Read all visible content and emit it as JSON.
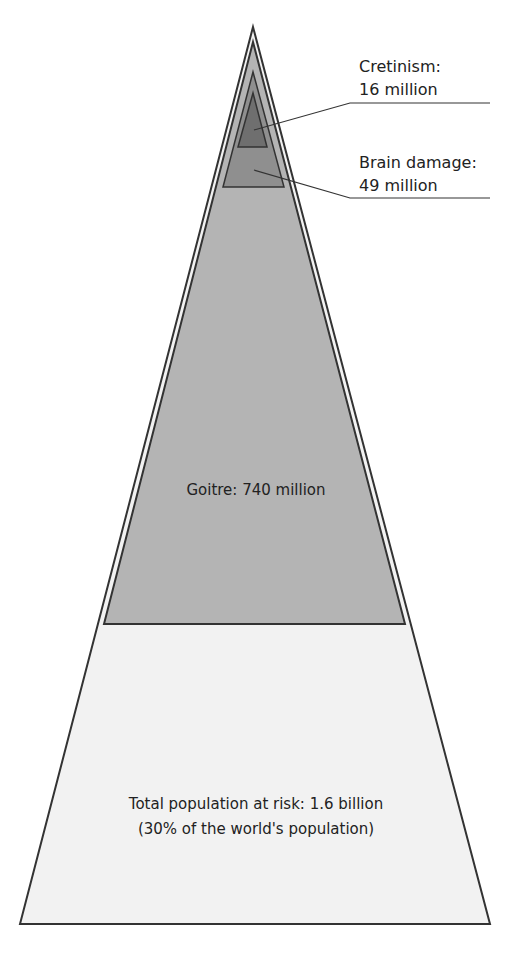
{
  "levels": {
    "cretinism": {
      "label_line1": "Cretinism:",
      "label_line2": "16 million",
      "value_millions": 16,
      "color": "#6f6f6f"
    },
    "brain_damage": {
      "label_line1": "Brain damage:",
      "label_line2": "49 million",
      "value_millions": 49,
      "color": "#8f8f8f"
    },
    "goitre": {
      "label": "Goitre: 740 million",
      "value_millions": 740,
      "color": "#b4b4b4"
    },
    "total": {
      "label_line1": "Total population at risk: 1.6 billion",
      "label_line2": "(30% of the world's population)",
      "value_millions": 1600,
      "color": "#f2f2f2"
    }
  },
  "colors": {
    "outline": "#333333",
    "band": "#f4f4f4"
  }
}
